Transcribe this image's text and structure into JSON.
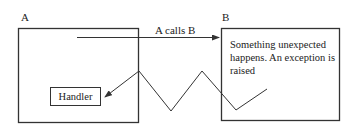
{
  "diagram": {
    "nodes": {
      "a": {
        "label": "A"
      },
      "b": {
        "label": "B",
        "text": "Something unexpected happens. An exception is raised"
      },
      "handler": {
        "label": "Handler"
      }
    },
    "edges": {
      "call": {
        "label": "A calls B",
        "from": "A",
        "to": "B"
      },
      "exception": {
        "label": "",
        "from": "B",
        "to": "Handler",
        "style": "zigzag"
      }
    },
    "colors": {
      "line": "#333333",
      "background": "#ffffff"
    }
  }
}
